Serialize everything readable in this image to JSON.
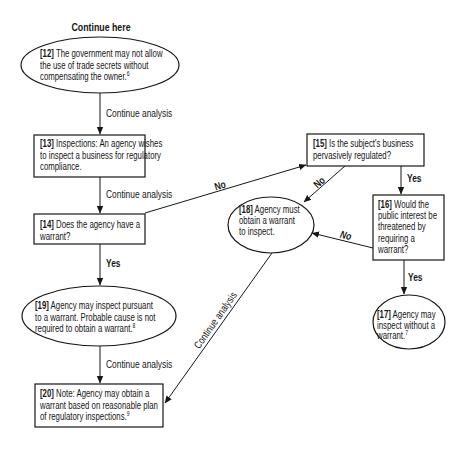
{
  "diagram": {
    "start_label": "Continue here",
    "colors": {
      "stroke": "#161616",
      "background": "#ffffff",
      "text": "#161616"
    },
    "nodes": {
      "n12": {
        "number": "[12]",
        "shape": "ellipse",
        "lines": [
          " The government may not allow",
          "the use of trade secrets without",
          "compensating the owner."
        ],
        "footnote": "6"
      },
      "n13": {
        "number": "[13]",
        "shape": "rectangle",
        "lines": [
          " Inspections: An agency wishes",
          "to inspect a business for regulatory",
          "compliance."
        ]
      },
      "n14": {
        "number": "[14]",
        "shape": "rectangle",
        "lines": [
          " Does the agency have a",
          "warrant?"
        ]
      },
      "n15": {
        "number": "[15]",
        "shape": "rectangle",
        "lines": [
          " Is the subject's business",
          "pervasively regulated?"
        ]
      },
      "n16": {
        "number": "[16]",
        "shape": "rectangle",
        "lines": [
          " Would the",
          "public interest be",
          "threatened by",
          "requiring a",
          "warrant?"
        ]
      },
      "n17": {
        "number": "[17]",
        "shape": "ellipse",
        "lines": [
          " Agency may",
          "inspect without a",
          "warrant."
        ],
        "footnote": "7"
      },
      "n18": {
        "number": "[18]",
        "shape": "ellipse",
        "lines": [
          " Agency must",
          "obtain a warrant",
          "to inspect."
        ]
      },
      "n19": {
        "number": "[19]",
        "shape": "ellipse",
        "lines": [
          " Agency may inspect pursuant",
          "to a warrant. Probable cause is not",
          "required to obtain a warrant."
        ],
        "footnote": "8"
      },
      "n20": {
        "number": "[20]",
        "shape": "rectangle",
        "lines": [
          " Note: Agency may obtain a",
          "warrant based on reasonable plan",
          "of regulatory inspections."
        ],
        "footnote": "9"
      }
    },
    "edges": [
      {
        "from": "12",
        "to": "13",
        "label": "Continue analysis"
      },
      {
        "from": "13",
        "to": "14",
        "label": "Continue analysis"
      },
      {
        "from": "14",
        "to": "15",
        "label": "No"
      },
      {
        "from": "14",
        "to": "19",
        "label": "Yes"
      },
      {
        "from": "15",
        "to": "18",
        "label": "No"
      },
      {
        "from": "15",
        "to": "16",
        "label": "Yes"
      },
      {
        "from": "16",
        "to": "18",
        "label": "No"
      },
      {
        "from": "16",
        "to": "17",
        "label": "Yes"
      },
      {
        "from": "18",
        "to": "20",
        "label": "Continue analysis"
      },
      {
        "from": "19",
        "to": "20",
        "label": "Continue analysis"
      }
    ]
  }
}
